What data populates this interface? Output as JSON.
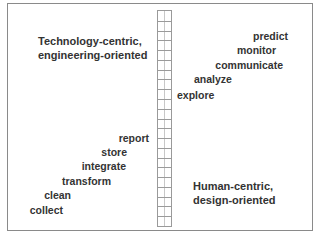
{
  "diagram": {
    "type": "ladder-spectrum",
    "top_left_heading": [
      "Technology-centric,",
      "engineering-oriented"
    ],
    "bottom_right_heading": [
      "Human-centric,",
      "design-oriented"
    ],
    "ladder_rungs": 22,
    "left_steps": [
      "report",
      "store",
      "integrate",
      "transform",
      "clean",
      "collect"
    ],
    "right_steps": [
      "predict",
      "monitor",
      "communicate",
      "analyze",
      "explore"
    ],
    "colors": {
      "text": "#333333",
      "border": "#8a8a8a",
      "ladder": "#9a9a9a"
    }
  }
}
